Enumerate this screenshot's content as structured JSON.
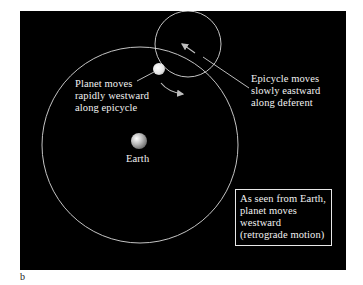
{
  "figure": {
    "panel_letter": "b",
    "background_color": "#000000",
    "line_color": "#d9d9d9",
    "labels": {
      "planet": "Planet moves\nrapidly westward\nalong epicycle",
      "epicycle": "Epicycle moves\nslowly eastward\nalong deferent",
      "earth": "Earth",
      "retrograde_box": "As seen from Earth,\nplanet moves\nwestward\n(retrograde motion)"
    },
    "elements": {
      "deferent": {
        "cx": 140,
        "cy": 145,
        "r": 98
      },
      "epicycle": {
        "cx": 188,
        "cy": 44,
        "r": 33
      },
      "planet": {
        "cx": 159,
        "cy": 69,
        "r": 6
      },
      "earth": {
        "cx": 139,
        "cy": 141,
        "r": 8
      }
    }
  }
}
